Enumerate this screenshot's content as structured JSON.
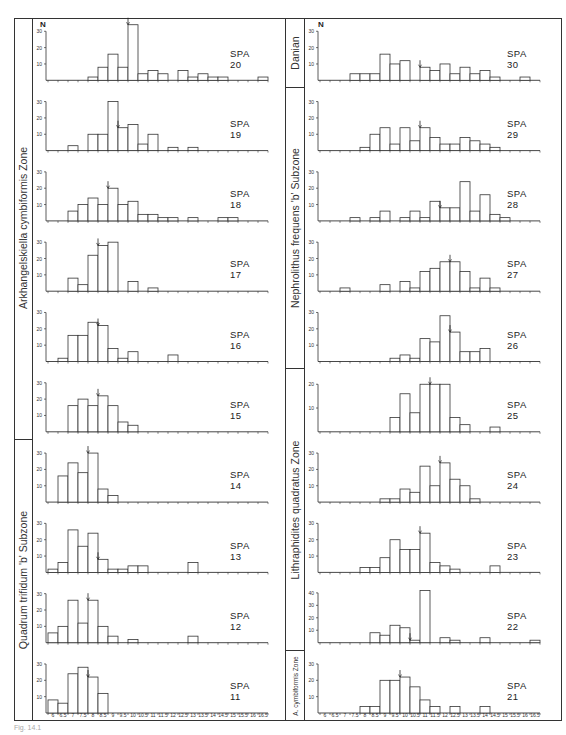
{
  "figure": {
    "y_axis_label": "N",
    "x_ticks": [
      "6",
      "6.5",
      "7",
      "7.5",
      "8",
      "8.5",
      "9",
      "9.5",
      "10",
      "10.5",
      "11",
      "11.5",
      "12",
      "12.5",
      "13",
      "13.5",
      "14",
      "14.5",
      "15",
      "15.5",
      "16",
      "16.5"
    ],
    "caption": "Fig. 14.1"
  },
  "zones": {
    "left": [
      {
        "label": "Arkhangelskiella cymbiformis Zone",
        "panels": 6
      },
      {
        "label": "Quadrum trifidum 'b' Subzone",
        "panels": 4
      }
    ],
    "right": [
      {
        "label": "Danian",
        "panels": 1
      },
      {
        "label": "Nephrolithus frequens 'b' Subzone",
        "panels": 4
      },
      {
        "label": "Lithraphidites quadratus Zone",
        "panels": 4
      },
      {
        "label": "A. cymbiformis Zone",
        "panels": 1
      }
    ]
  },
  "chart_data": {
    "type": "bar",
    "xlabel": "size class (bins 6 to 16.5, step 0.5)",
    "ylabel": "N",
    "categories": [
      "6",
      "6.5",
      "7",
      "7.5",
      "8",
      "8.5",
      "9",
      "9.5",
      "10",
      "10.5",
      "11",
      "11.5",
      "12",
      "12.5",
      "13",
      "13.5",
      "14",
      "14.5",
      "15",
      "15.5",
      "16",
      "16.5"
    ],
    "series": [
      {
        "name": "SPA 20",
        "mean_arrow": 10,
        "ymax": 30,
        "values": [
          0,
          0,
          0,
          0,
          2,
          8,
          16,
          8,
          34,
          4,
          6,
          4,
          0,
          6,
          2,
          4,
          2,
          2,
          0,
          0,
          0,
          2
        ]
      },
      {
        "name": "SPA 19",
        "mean_arrow": 9.5,
        "ymax": 30,
        "values": [
          0,
          0,
          3,
          0,
          10,
          10,
          30,
          14,
          16,
          4,
          10,
          0,
          2,
          0,
          2,
          0,
          0,
          0,
          0,
          0,
          0,
          0
        ]
      },
      {
        "name": "SPA 18",
        "mean_arrow": 9,
        "ymax": 30,
        "values": [
          0,
          0,
          6,
          10,
          14,
          10,
          20,
          10,
          12,
          4,
          4,
          2,
          2,
          0,
          2,
          0,
          0,
          2,
          2,
          0,
          0,
          0
        ]
      },
      {
        "name": "SPA 17",
        "mean_arrow": 8.5,
        "ymax": 30,
        "values": [
          0,
          0,
          8,
          4,
          22,
          28,
          30,
          0,
          6,
          0,
          2,
          0,
          0,
          0,
          0,
          0,
          0,
          0,
          0,
          0,
          0,
          0
        ]
      },
      {
        "name": "SPA 16",
        "mean_arrow": 8.5,
        "ymax": 30,
        "values": [
          0,
          2,
          16,
          16,
          24,
          22,
          8,
          2,
          6,
          0,
          0,
          0,
          4,
          0,
          0,
          0,
          0,
          0,
          0,
          0,
          0,
          0
        ]
      },
      {
        "name": "SPA 15",
        "mean_arrow": 8.5,
        "ymax": 30,
        "values": [
          0,
          0,
          16,
          20,
          16,
          22,
          16,
          6,
          4,
          0,
          0,
          0,
          0,
          0,
          0,
          0,
          0,
          0,
          0,
          0,
          0,
          0
        ]
      },
      {
        "name": "SPA 14",
        "mean_arrow": 8,
        "ymax": 30,
        "values": [
          0,
          16,
          24,
          18,
          30,
          8,
          4,
          0,
          0,
          0,
          0,
          0,
          0,
          0,
          0,
          0,
          0,
          0,
          0,
          0,
          0,
          0
        ]
      },
      {
        "name": "SPA 13",
        "mean_arrow": 8.5,
        "ymax": 30,
        "values": [
          2,
          6,
          26,
          16,
          24,
          8,
          2,
          2,
          4,
          4,
          0,
          0,
          0,
          0,
          6,
          0,
          0,
          0,
          0,
          0,
          0,
          0
        ]
      },
      {
        "name": "SPA 12",
        "mean_arrow": 8,
        "ymax": 30,
        "values": [
          6,
          10,
          26,
          12,
          26,
          10,
          4,
          0,
          2,
          0,
          0,
          0,
          0,
          0,
          4,
          0,
          0,
          0,
          0,
          0,
          0,
          0
        ]
      },
      {
        "name": "SPA 11",
        "mean_arrow": 8,
        "ymax": 30,
        "values": [
          8,
          6,
          24,
          28,
          22,
          12,
          0,
          0,
          0,
          0,
          0,
          0,
          0,
          0,
          0,
          0,
          0,
          0,
          0,
          0,
          0,
          0
        ]
      },
      {
        "name": "SPA 30",
        "mean_arrow": 11,
        "ymax": 30,
        "values": [
          0,
          0,
          0,
          4,
          4,
          4,
          16,
          10,
          12,
          0,
          8,
          6,
          10,
          4,
          8,
          4,
          6,
          2,
          0,
          0,
          2,
          0
        ]
      },
      {
        "name": "SPA 29",
        "mean_arrow": 11,
        "ymax": 30,
        "values": [
          0,
          0,
          0,
          0,
          2,
          10,
          14,
          4,
          14,
          6,
          14,
          8,
          4,
          4,
          8,
          6,
          4,
          2,
          0,
          0,
          0,
          0
        ]
      },
      {
        "name": "SPA 28",
        "mean_arrow": 12,
        "ymax": 30,
        "values": [
          0,
          0,
          0,
          2,
          0,
          2,
          6,
          0,
          2,
          6,
          2,
          12,
          8,
          8,
          24,
          6,
          16,
          4,
          2,
          0,
          0,
          0
        ]
      },
      {
        "name": "SPA 27",
        "mean_arrow": 12.5,
        "ymax": 30,
        "values": [
          0,
          0,
          2,
          0,
          0,
          0,
          4,
          0,
          6,
          2,
          12,
          14,
          18,
          18,
          12,
          2,
          8,
          2,
          0,
          0,
          0,
          0
        ]
      },
      {
        "name": "SPA 26",
        "mean_arrow": 12.5,
        "ymax": 30,
        "values": [
          0,
          0,
          0,
          0,
          0,
          0,
          0,
          2,
          4,
          2,
          14,
          12,
          28,
          18,
          6,
          6,
          8,
          0,
          0,
          0,
          0,
          0
        ]
      },
      {
        "name": "SPA 25",
        "mean_arrow": 11.5,
        "ymax": 20,
        "values": [
          0,
          0,
          0,
          0,
          0,
          0,
          0,
          6,
          16,
          8,
          20,
          20,
          20,
          6,
          3,
          0,
          0,
          2,
          0,
          0,
          0,
          0
        ]
      },
      {
        "name": "SPA 24",
        "mean_arrow": 12,
        "ymax": 30,
        "values": [
          0,
          0,
          0,
          0,
          0,
          0,
          2,
          2,
          8,
          6,
          22,
          10,
          24,
          14,
          10,
          2,
          0,
          0,
          0,
          0,
          0,
          0
        ]
      },
      {
        "name": "SPA 23",
        "mean_arrow": 11,
        "ymax": 30,
        "values": [
          0,
          0,
          0,
          0,
          3,
          3,
          9,
          20,
          14,
          14,
          24,
          6,
          4,
          2,
          0,
          0,
          0,
          4,
          0,
          0,
          0,
          0
        ]
      },
      {
        "name": "SPA 22",
        "mean_arrow": 10.5,
        "ymax": 40,
        "values": [
          0,
          0,
          0,
          0,
          0,
          8,
          6,
          14,
          12,
          2,
          42,
          0,
          4,
          2,
          0,
          0,
          4,
          0,
          0,
          0,
          0,
          2
        ]
      },
      {
        "name": "SPA 21",
        "mean_arrow": 10,
        "ymax": 30,
        "values": [
          0,
          0,
          0,
          0,
          4,
          4,
          20,
          20,
          22,
          16,
          8,
          4,
          0,
          4,
          0,
          0,
          4,
          0,
          0,
          0,
          0,
          0
        ]
      }
    ],
    "layout": {
      "columns": 2,
      "panels_per_column": 10,
      "grid": false,
      "legend": "none"
    }
  }
}
